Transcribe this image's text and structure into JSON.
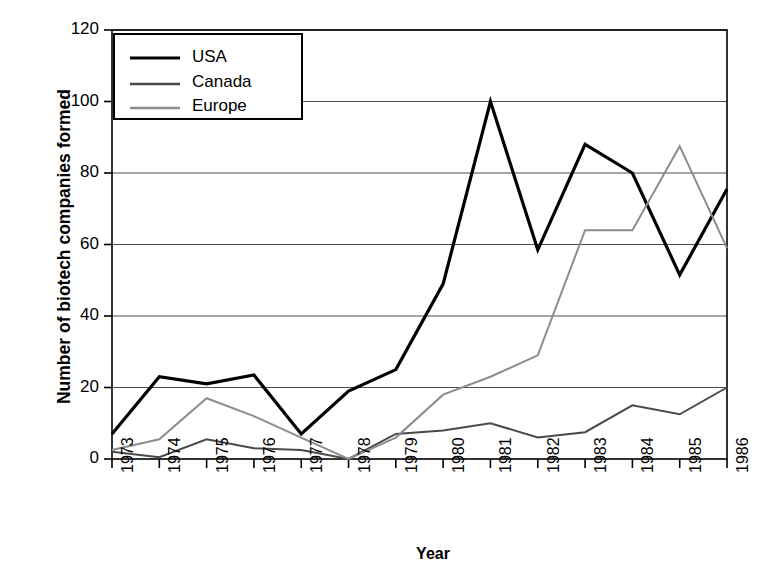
{
  "chart_data": {
    "type": "line",
    "title": "",
    "xlabel": "Year",
    "ylabel": "Number of biotech companies formed",
    "categories": [
      "1973",
      "1974",
      "1975",
      "1976",
      "1977",
      "1978",
      "1979",
      "1980",
      "1981",
      "1982",
      "1983",
      "1984",
      "1985",
      "1986"
    ],
    "xlim": [
      1973,
      1986
    ],
    "ylim": [
      0,
      120
    ],
    "yticks": [
      0,
      20,
      40,
      60,
      80,
      100,
      120
    ],
    "grid": "horizontal",
    "legend_position": "top-left-inside",
    "series": [
      {
        "name": "USA",
        "color": "#000000",
        "width": 3.2,
        "values": [
          7,
          23,
          21,
          23.5,
          7,
          19,
          25,
          49,
          100,
          58.5,
          88,
          80,
          51.5,
          75.5
        ]
      },
      {
        "name": "Canada",
        "color": "#4a4a4a",
        "width": 2.0,
        "values": [
          2,
          0.5,
          5.5,
          3,
          2.5,
          0,
          7,
          8,
          10,
          6,
          7.5,
          15,
          12.5,
          20
        ]
      },
      {
        "name": "Europe",
        "color": "#8c8c8c",
        "width": 2.0,
        "values": [
          2.5,
          5.5,
          17,
          12,
          6,
          0,
          6,
          18,
          23,
          29,
          64,
          64,
          87.5,
          59
        ]
      }
    ]
  },
  "axes": {
    "ytick_labels": [
      "120",
      "100",
      "80",
      "60",
      "40",
      "20",
      "0"
    ],
    "xtick_labels": [
      "1973",
      "1974",
      "1975",
      "1976",
      "1977",
      "1978",
      "1979",
      "1980",
      "1981",
      "1982",
      "1983",
      "1984",
      "1985",
      "1986"
    ]
  },
  "legend": {
    "entries": [
      {
        "label": "USA"
      },
      {
        "label": "Canada"
      },
      {
        "label": "Europe"
      }
    ]
  },
  "caption": {
    "partial_text": ""
  }
}
